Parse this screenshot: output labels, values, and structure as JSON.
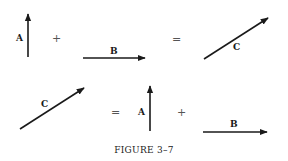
{
  "figure": {
    "caption": "FIGURE 3–7",
    "equations": [
      {
        "row": "top",
        "terms": [
          "A",
          "+",
          "B",
          "=",
          "C"
        ],
        "vectors": {
          "A": {
            "label": "A",
            "from": [
              28,
              57
            ],
            "to": [
              28,
              13
            ],
            "direction": "up"
          },
          "B": {
            "label": "B",
            "from": [
              83,
              58
            ],
            "to": [
              146,
              58
            ],
            "direction": "right"
          },
          "C": {
            "label": "C",
            "from": [
              204,
              59
            ],
            "to": [
              269,
              17
            ],
            "direction": "up-right"
          }
        },
        "operators": {
          "plus": "+",
          "equals": "="
        }
      },
      {
        "row": "bottom",
        "terms": [
          "C",
          "=",
          "A",
          "+",
          "B"
        ],
        "vectors": {
          "C": {
            "label": "C",
            "from": [
              20,
              129
            ],
            "to": [
              85,
              87
            ],
            "direction": "up-right"
          },
          "A": {
            "label": "A",
            "from": [
              150,
              131
            ],
            "to": [
              150,
              85
            ],
            "direction": "up"
          },
          "B": {
            "label": "B",
            "from": [
              203,
              132
            ],
            "to": [
              268,
              132
            ],
            "direction": "right"
          }
        },
        "operators": {
          "equals": "=",
          "plus": "+"
        }
      }
    ]
  }
}
